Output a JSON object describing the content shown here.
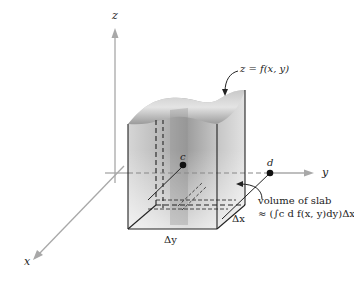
{
  "figure": {
    "axes": {
      "x_label": "x",
      "y_label": "y",
      "z_label": "z"
    },
    "surface_label": "z = f(x, y)",
    "points": {
      "c_label": "c",
      "d_label": "d"
    },
    "dimensions": {
      "delta_x": "Δx",
      "delta_y": "Δy"
    },
    "annotation": {
      "line1": "volume of slab",
      "line2": "≈ (∫c d f(x, y)dy)Δx"
    },
    "colors": {
      "axis": "#a8a8a8",
      "surface_light": "#d9d9d9",
      "surface_dark": "#8a8a8a",
      "slab": "#b5b5b5",
      "lines": "#222222"
    }
  }
}
